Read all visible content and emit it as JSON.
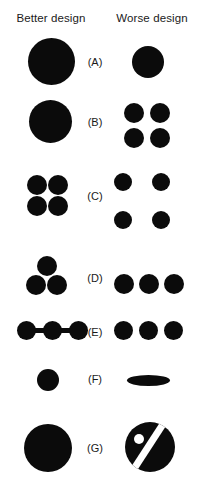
{
  "figure": {
    "columns": {
      "better": "Better design",
      "worse": "Worse design"
    },
    "ink_color": "#0b0b0b",
    "background_color": "#ffffff",
    "rows": [
      {
        "label": "(A)",
        "better_description": "one large filled circle",
        "worse_description": "one smaller filled circle"
      },
      {
        "label": "(B)",
        "better_description": "one large filled circle",
        "worse_description": "four medium filled circles in a 2 by 2 block"
      },
      {
        "label": "(C)",
        "better_description": "four small filled circles tightly grouped in a 2 by 2 block",
        "worse_description": "four small filled circles widely spaced in a 2 by 2 block"
      },
      {
        "label": "(D)",
        "better_description": "three filled circles arranged as a triangle",
        "worse_description": "three filled circles arranged in a horizontal row"
      },
      {
        "label": "(E)",
        "better_description": "three filled circles joined by connecting bars",
        "worse_description": "three separate filled circles in a row"
      },
      {
        "label": "(F)",
        "better_description": "one small filled circle",
        "worse_description": "one flattened horizontal ellipse"
      },
      {
        "label": "(G)",
        "better_description": "one plain large filled circle",
        "worse_description": "large filled circle cut by a white diagonal slash with a white dot"
      }
    ]
  }
}
